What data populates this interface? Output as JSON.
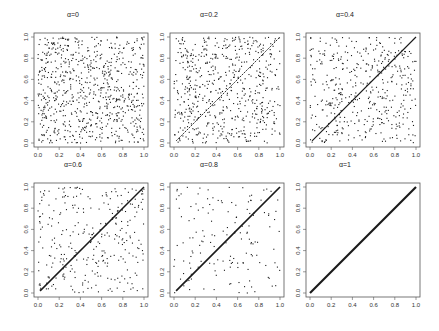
{
  "figure": {
    "layout": {
      "rows": 2,
      "cols": 3
    },
    "point_color": "#1a1a1a",
    "axis_color": "#555555",
    "background": "#ffffff"
  },
  "chart_data": [
    {
      "type": "scatter",
      "title": "α=0",
      "alpha": 0,
      "n_points": 1000,
      "xlabel": "",
      "ylabel": "",
      "xlim": [
        0,
        1
      ],
      "ylim": [
        0,
        1
      ],
      "xticks": [
        "0.0",
        "0.2",
        "0.4",
        "0.6",
        "0.8",
        "1.0"
      ],
      "yticks": [
        "0.0",
        "0.2",
        "0.4",
        "0.6",
        "0.8",
        "1.0"
      ],
      "grid": false,
      "description": "uniform random points on the unit square"
    },
    {
      "type": "scatter",
      "title": "α=0.2",
      "alpha": 0.2,
      "n_points": 1000,
      "xlabel": "",
      "ylabel": "",
      "xlim": [
        0,
        1
      ],
      "ylim": [
        0,
        1
      ],
      "xticks": [
        "0.0",
        "0.2",
        "0.4",
        "0.6",
        "0.8",
        "1.0"
      ],
      "yticks": [
        "0.0",
        "0.2",
        "0.4",
        "0.6",
        "0.8",
        "1.0"
      ],
      "grid": false,
      "description": "mixture: fraction alpha of points on diagonal y=x, rest uniform"
    },
    {
      "type": "scatter",
      "title": "α=0.4",
      "alpha": 0.4,
      "n_points": 1000,
      "xlabel": "",
      "ylabel": "",
      "xlim": [
        0,
        1
      ],
      "ylim": [
        0,
        1
      ],
      "xticks": [
        "0.0",
        "0.2",
        "0.4",
        "0.6",
        "0.8",
        "1.0"
      ],
      "yticks": [
        "0.0",
        "0.2",
        "0.4",
        "0.6",
        "0.8",
        "1.0"
      ],
      "grid": false,
      "description": "mixture: fraction alpha of points on diagonal y=x, rest uniform"
    },
    {
      "type": "scatter",
      "title": "α=0.6",
      "alpha": 0.6,
      "n_points": 1000,
      "xlabel": "",
      "ylabel": "",
      "xlim": [
        0,
        1
      ],
      "ylim": [
        0,
        1
      ],
      "xticks": [
        "0.0",
        "0.2",
        "0.4",
        "0.6",
        "0.8",
        "1.0"
      ],
      "yticks": [
        "0.0",
        "0.2",
        "0.4",
        "0.6",
        "0.8",
        "1.0"
      ],
      "grid": false,
      "description": "mixture: fraction alpha of points on diagonal y=x, rest uniform"
    },
    {
      "type": "scatter",
      "title": "α=0.8",
      "alpha": 0.8,
      "n_points": 1000,
      "xlabel": "",
      "ylabel": "",
      "xlim": [
        0,
        1
      ],
      "ylim": [
        0,
        1
      ],
      "xticks": [
        "0.0",
        "0.2",
        "0.4",
        "0.6",
        "0.8",
        "1.0"
      ],
      "yticks": [
        "0.0",
        "0.2",
        "0.4",
        "0.6",
        "0.8",
        "1.0"
      ],
      "grid": false,
      "description": "mixture: fraction alpha of points on diagonal y=x, rest uniform"
    },
    {
      "type": "scatter",
      "title": "α=1",
      "alpha": 1,
      "n_points": 1000,
      "xlabel": "",
      "ylabel": "",
      "xlim": [
        0,
        1
      ],
      "ylim": [
        0,
        1
      ],
      "xticks": [
        "0.0",
        "0.2",
        "0.4",
        "0.6",
        "0.8",
        "1.0"
      ],
      "yticks": [
        "0.0",
        "0.2",
        "0.4",
        "0.6",
        "0.8",
        "1.0"
      ],
      "grid": false,
      "description": "all points on diagonal y=x"
    }
  ]
}
